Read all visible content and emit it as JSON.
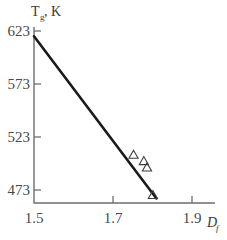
{
  "chart_data": {
    "type": "line",
    "title": "",
    "subtitle": "",
    "xlabel": "D",
    "xlabel_sub": "f",
    "ylabel": "T",
    "ylabel_sub": "g",
    "ylabel_unit": ", K",
    "xlim": [
      1.5,
      1.95
    ],
    "ylim": [
      455,
      640
    ],
    "xticks": [
      1.5,
      1.7,
      1.9
    ],
    "xtick_labels": [
      "1.5",
      "1.7",
      "1.9"
    ],
    "yticks": [
      473,
      523,
      573,
      623
    ],
    "ytick_labels": [
      "473",
      "523",
      "573",
      "623"
    ],
    "grid": false,
    "legend": null,
    "series": [
      {
        "name": "fit-line",
        "type": "line",
        "x": [
          1.5,
          1.81
        ],
        "y": [
          618,
          465
        ],
        "color": "#1a1a1a"
      },
      {
        "name": "data-points",
        "type": "scatter",
        "marker": "open-triangle",
        "color": "#3d3d3d",
        "points": [
          {
            "x": 1.752,
            "y": 506
          },
          {
            "x": 1.778,
            "y": 500
          },
          {
            "x": 1.786,
            "y": 494
          },
          {
            "x": 1.801,
            "y": 468
          }
        ]
      }
    ],
    "axes_style": {
      "spines": [
        "left",
        "bottom"
      ],
      "tick_direction": "out",
      "axis_color": "#6e6e6e"
    }
  },
  "figure": {
    "background_color": "#ffffff",
    "width": 227,
    "height": 240
  }
}
